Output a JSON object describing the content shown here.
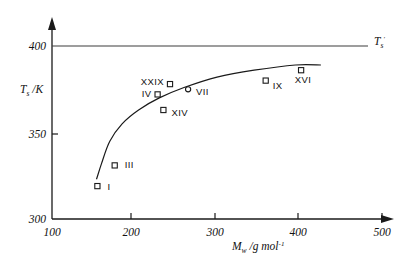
{
  "chart_data": {
    "type": "scatter",
    "title": "",
    "xlabel": "M_w /g mol^-1",
    "ylabel": "T_s /K",
    "xlim": [
      100,
      500
    ],
    "ylim": [
      300,
      405
    ],
    "xticks": [
      100,
      200,
      300,
      400,
      500
    ],
    "yticks": [
      300,
      350,
      400
    ],
    "xtick_labels": [
      "100",
      "200",
      "300",
      "400",
      "500"
    ],
    "ytick_labels": [
      "300",
      "350",
      "400"
    ],
    "grid": false,
    "legend": "none",
    "asymptote": {
      "value": 400,
      "label": "T",
      "label_sub": "s",
      "label_sup": "'"
    },
    "points": [
      {
        "label": "I",
        "marker": "square",
        "x": 155,
        "y": 319
      },
      {
        "label": "III",
        "marker": "square",
        "x": 176,
        "y": 331
      },
      {
        "label": "IV",
        "marker": "square",
        "x": 228,
        "y": 372
      },
      {
        "label": "XIV",
        "marker": "square",
        "x": 235,
        "y": 363
      },
      {
        "label": "XXIX",
        "marker": "square",
        "x": 243,
        "y": 378
      },
      {
        "label": "VII",
        "marker": "circle",
        "x": 265,
        "y": 375
      },
      {
        "label": "IX",
        "marker": "square",
        "x": 359,
        "y": 380
      },
      {
        "label": "XVI",
        "marker": "square",
        "x": 402,
        "y": 386
      }
    ],
    "fit_curve": {
      "description": "monotonic saturating curve approaching Ts' = 400 K",
      "x": [
        154,
        160,
        170,
        185,
        205,
        230,
        260,
        300,
        345,
        395,
        426
      ],
      "y": [
        323,
        332,
        345,
        355,
        363,
        370,
        376,
        382,
        386,
        389,
        389
      ]
    }
  },
  "axis": {
    "y_title_main": "T",
    "y_title_sub": "s",
    "y_title_unit": " /K",
    "x_title_main": "M",
    "x_title_sub": "w",
    "x_title_unit": " /g mol",
    "x_title_sup": "-1"
  }
}
